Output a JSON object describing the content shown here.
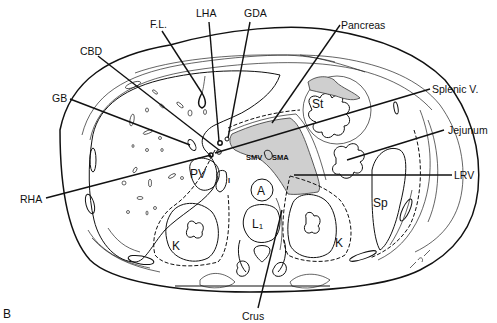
{
  "figure": {
    "panel_label": "B",
    "colors": {
      "ink": "#111111",
      "shading": "#cfcfcf",
      "background": "#ffffff"
    },
    "labels": {
      "fl": "F.L.",
      "lha": "LHA",
      "gda": "GDA",
      "pancreas": "Pancreas",
      "cbd": "CBD",
      "splenic_v": "Splenic V.",
      "gb": "GB",
      "jejunum": "Jejunum",
      "rha": "RHA",
      "lrv": "LRV",
      "crus": "Crus"
    },
    "organ_labels": {
      "stomach": "St",
      "portal_vein": "PV",
      "aorta": "A",
      "vertebra": "L",
      "vertebra_sub": "1",
      "kidney_right": "K",
      "kidney_left": "K",
      "spleen": "Sp",
      "smv": "SMV",
      "sma": "SMA",
      "ivc": "I"
    }
  }
}
